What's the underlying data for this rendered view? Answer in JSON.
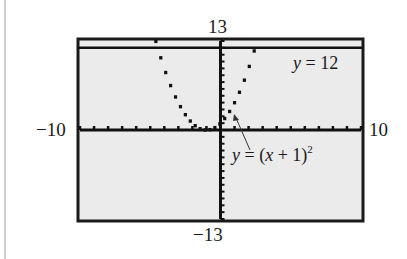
{
  "chart_data": {
    "type": "line",
    "title": "",
    "xlabel": "",
    "ylabel": "",
    "xlim": [
      -10,
      10
    ],
    "ylim": [
      -13,
      13
    ],
    "x_ticks_step": 1,
    "y_ticks_step": 1,
    "grid": false,
    "window_labels": {
      "ymax": "13",
      "ymin": "−13",
      "xmin": "−10",
      "xmax": "10"
    },
    "series": [
      {
        "name": "y = (x + 1)^2",
        "equation": "(x+1)^2",
        "label_y": "y",
        "label_eq": " = (",
        "label_x": "x",
        "label_rest": " + 1)",
        "label_exp": "2",
        "style": "dotted-pixel"
      },
      {
        "name": "y = 12",
        "equation": "12",
        "label_y": "y",
        "label_rest": " = 12",
        "style": "solid"
      }
    ],
    "annotations": [
      {
        "text": "y = 12",
        "target": "horizontal line y = 12"
      },
      {
        "text": "y = (x + 1)^2",
        "target": "parabola near vertex",
        "arrow": true
      }
    ],
    "background": "#ebebeb",
    "frame_color": "#1a1a1a"
  }
}
